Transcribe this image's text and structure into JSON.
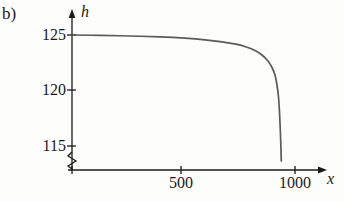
{
  "figure": {
    "panel_label": "b)",
    "background_color": "#fdfdfc",
    "curve_color": "#5a5a5a",
    "axis_color": "#1a1a1a"
  },
  "axes": {
    "y_axis_name": "h",
    "x_axis_name": "x",
    "y_ticks": [
      {
        "label": "125",
        "value": 125,
        "py": 35
      },
      {
        "label": "120",
        "value": 120,
        "py": 90
      },
      {
        "label": "115",
        "value": 115,
        "py": 146
      }
    ],
    "x_ticks": [
      {
        "label": "500",
        "value": 500,
        "px": 181
      },
      {
        "label": "1000",
        "value": 1000,
        "px": 295
      }
    ],
    "y_axis_break": true,
    "grid": false
  },
  "chart_data": {
    "type": "line",
    "title": "",
    "subtitle": "",
    "xlabel": "x",
    "ylabel": "h",
    "xlim": [
      0,
      1150
    ],
    "ylim": [
      113,
      126.5
    ],
    "grid": false,
    "legend": null,
    "annotations": [
      "b)"
    ],
    "axis_break_y": true,
    "series": [
      {
        "name": "h(x)",
        "x": [
          0,
          50,
          100,
          150,
          200,
          250,
          300,
          350,
          400,
          450,
          500,
          550,
          600,
          650,
          700,
          750,
          800,
          830,
          860,
          880,
          900,
          915,
          925,
          930
        ],
        "values": [
          125.0,
          124.98,
          124.95,
          124.92,
          124.88,
          124.84,
          124.79,
          124.73,
          124.66,
          124.57,
          124.47,
          124.35,
          124.2,
          124.02,
          123.8,
          123.5,
          123.05,
          122.65,
          122.05,
          121.45,
          120.4,
          119.0,
          117.2,
          114.6
        ]
      }
    ],
    "pixel_path": {
      "comment": "curve traced in screenshot pixel coordinates",
      "points": [
        [
          72,
          35
        ],
        [
          100,
          35.4
        ],
        [
          130,
          36.0
        ],
        [
          160,
          36.9
        ],
        [
          185,
          38.2
        ],
        [
          205,
          39.8
        ],
        [
          222,
          41.8
        ],
        [
          236,
          44.2
        ],
        [
          247,
          47.2
        ],
        [
          255,
          50.5
        ],
        [
          262,
          55.0
        ],
        [
          268,
          61.0
        ],
        [
          272,
          67.5
        ],
        [
          275,
          75.0
        ],
        [
          277,
          85.0
        ],
        [
          278.5,
          97.0
        ],
        [
          279.5,
          112.0
        ],
        [
          280.3,
          130.0
        ],
        [
          281,
          150.0
        ],
        [
          281.3,
          161
        ]
      ]
    }
  }
}
